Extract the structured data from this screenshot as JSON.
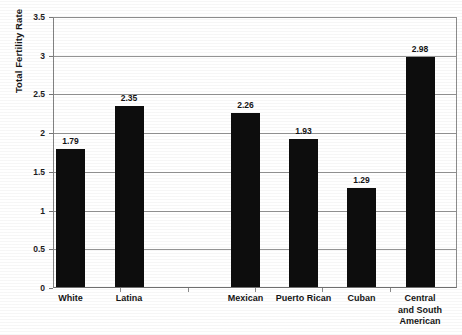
{
  "chart_data": {
    "type": "bar",
    "title": "",
    "xlabel": "",
    "ylabel": "Total Fertility Rate",
    "ylim": [
      0,
      3.5
    ],
    "ytick_labels": [
      "0",
      "0.5",
      "1",
      "1.5",
      "2",
      "2.5",
      "3",
      "3.5"
    ],
    "ytick_values": [
      0,
      0.5,
      1,
      1.5,
      2,
      2.5,
      3,
      3.5
    ],
    "grid": "horizontal",
    "legend": "none",
    "bar_color": "#0d0d0d",
    "categories": [
      "White",
      "Latina",
      "Mexican",
      "Puerto Rican",
      "Cuban",
      "Central and South American"
    ],
    "category_lines": [
      [
        "White"
      ],
      [
        "Latina"
      ],
      [
        "Mexican"
      ],
      [
        "Puerto Rican"
      ],
      [
        "Cuban"
      ],
      [
        "Central",
        "and South",
        "American"
      ]
    ],
    "values": [
      1.79,
      2.35,
      2.26,
      1.93,
      1.29,
      2.98
    ],
    "data_labels": [
      "1.79",
      "2.35",
      "2.26",
      "1.93",
      "1.29",
      "2.98"
    ]
  }
}
